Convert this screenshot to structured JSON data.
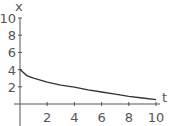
{
  "chart_data": {
    "type": "line",
    "title": "",
    "xlabel": "t",
    "ylabel": "x",
    "xlim": [
      0,
      10
    ],
    "ylim": [
      0,
      10
    ],
    "x_ticks": [
      "2",
      "4",
      "6",
      "8",
      "10"
    ],
    "y_ticks": [
      "2",
      "4",
      "6",
      "8",
      "10"
    ],
    "grid": false,
    "legend": null,
    "series": [
      {
        "name": "x(t)",
        "x": [
          0,
          0.5,
          1,
          2,
          3,
          4,
          5,
          6,
          7,
          8,
          9,
          10
        ],
        "y": [
          4.0,
          3.3,
          3.0,
          2.55,
          2.2,
          1.95,
          1.65,
          1.4,
          1.15,
          0.9,
          0.7,
          0.5
        ]
      }
    ],
    "colors": {
      "curve": "#333333",
      "axes": "#555555"
    }
  }
}
